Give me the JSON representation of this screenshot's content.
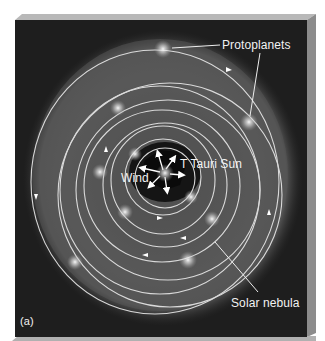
{
  "figure": {
    "panel_label": "(a)",
    "labels": {
      "protoplanets": "Protoplanets",
      "sun": "T Tauri Sun",
      "wind": "Wind",
      "nebula": "Solar nebula"
    },
    "colors": {
      "background": "#1c1c1c",
      "nebula": "#5a5a5a",
      "orbit": "#e8e8e8",
      "frame_top": "#b5b5b5",
      "frame_side": "#8a8a8a",
      "text": "#f2f2f2"
    },
    "sun": {
      "x": 165,
      "y": 173
    },
    "protoplanets": [
      {
        "x": 163,
        "y": 49
      },
      {
        "x": 118,
        "y": 108
      },
      {
        "x": 249,
        "y": 122
      },
      {
        "x": 135,
        "y": 154
      },
      {
        "x": 100,
        "y": 172
      },
      {
        "x": 191,
        "y": 197
      },
      {
        "x": 125,
        "y": 212
      },
      {
        "x": 212,
        "y": 219
      },
      {
        "x": 75,
        "y": 262
      },
      {
        "x": 188,
        "y": 260
      }
    ]
  }
}
